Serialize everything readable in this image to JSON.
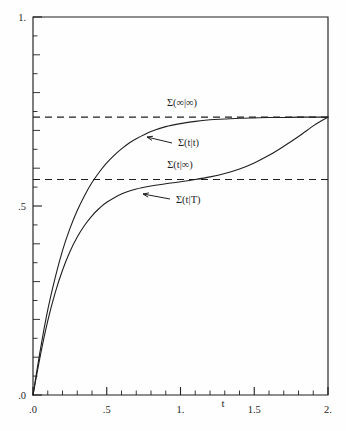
{
  "figure": {
    "background": "#fefefe",
    "ink_color": "#1f1f1f",
    "frame": {
      "left": 33,
      "top": 17,
      "right": 328,
      "bottom": 395
    }
  },
  "chart_data": {
    "type": "line",
    "title": "",
    "xlabel": "t",
    "ylabel": "",
    "xlim": [
      0.0,
      2.0
    ],
    "ylim": [
      0.0,
      1.0
    ],
    "grid": false,
    "legend": "none (inline curve annotations with arrows)",
    "x_ticks_major": [
      0.0,
      0.5,
      1.0,
      1.5,
      2.0
    ],
    "x_tick_labels": [
      ".0",
      ".5",
      "1.",
      "1.5",
      "2."
    ],
    "x_minor_step": 0.1,
    "y_ticks_major": [
      0.0,
      0.5,
      1.0
    ],
    "y_tick_labels": [
      ".0",
      ".5",
      "1."
    ],
    "y_minor_step": 0.05,
    "series": [
      {
        "name": "Σ(t|t)",
        "style": "solid",
        "label": "Σ(t|t)",
        "x": [
          0.0,
          0.05,
          0.1,
          0.15,
          0.2,
          0.25,
          0.3,
          0.35,
          0.4,
          0.45,
          0.5,
          0.55,
          0.6,
          0.65,
          0.7,
          0.8,
          0.9,
          1.0,
          1.1,
          1.2,
          1.3,
          1.4,
          1.5,
          1.6,
          1.7,
          1.8,
          1.9,
          2.0
        ],
        "values": [
          0.0,
          0.12,
          0.225,
          0.31,
          0.382,
          0.44,
          0.488,
          0.528,
          0.562,
          0.59,
          0.614,
          0.634,
          0.651,
          0.666,
          0.678,
          0.697,
          0.71,
          0.718,
          0.724,
          0.728,
          0.73,
          0.732,
          0.733,
          0.734,
          0.734,
          0.735,
          0.735,
          0.735
        ]
      },
      {
        "name": "Σ(t|T)",
        "style": "solid",
        "label": "Σ(t|T)",
        "x": [
          0.0,
          0.05,
          0.1,
          0.15,
          0.2,
          0.25,
          0.3,
          0.35,
          0.4,
          0.45,
          0.5,
          0.6,
          0.7,
          0.8,
          0.9,
          1.0,
          1.1,
          1.2,
          1.3,
          1.4,
          1.5,
          1.6,
          1.7,
          1.8,
          1.9,
          1.95,
          2.0
        ],
        "values": [
          0.0,
          0.105,
          0.196,
          0.27,
          0.33,
          0.379,
          0.418,
          0.449,
          0.474,
          0.494,
          0.51,
          0.532,
          0.545,
          0.553,
          0.559,
          0.564,
          0.57,
          0.577,
          0.586,
          0.598,
          0.614,
          0.634,
          0.658,
          0.684,
          0.712,
          0.724,
          0.735
        ]
      }
    ],
    "reference_lines": [
      {
        "name": "Σ(∞|∞)",
        "label": "Σ(∞|∞)",
        "y": 0.735,
        "style": "dashed"
      },
      {
        "name": "Σ(t|∞)",
        "label": "Σ(t|∞)",
        "y": 0.57,
        "style": "dashed"
      }
    ],
    "annotations": [
      {
        "name": "sigma-inf-inf",
        "text": "Σ(∞|∞)",
        "x_px": 182,
        "y_px": 106,
        "arrow": false
      },
      {
        "name": "sigma-t-t",
        "text": "Σ(t|t)",
        "x_px": 178,
        "y_px": 146,
        "arrow": true,
        "arrow_from_px": [
          172,
          143
        ],
        "arrow_to_px": [
          147,
          137
        ]
      },
      {
        "name": "sigma-t-inf",
        "text": "Σ(t|∞)",
        "x_px": 180,
        "y_px": 168,
        "arrow": false
      },
      {
        "name": "sigma-t-T",
        "text": "Σ(t|T)",
        "x_px": 176,
        "y_px": 203,
        "arrow": true,
        "arrow_from_px": [
          170,
          199
        ],
        "arrow_to_px": [
          143,
          194
        ]
      }
    ]
  }
}
